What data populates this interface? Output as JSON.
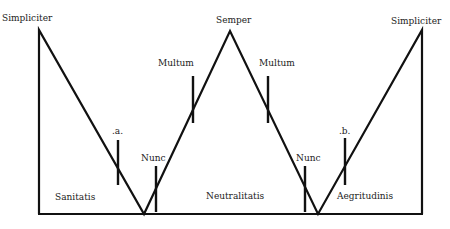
{
  "colors": {
    "line": "#111111",
    "text": "#222222",
    "background": "#ffffff"
  },
  "labels": {
    "simpliciter_left": "Simpliciter",
    "semper": "Semper",
    "simpliciter_right": "Simpliciter",
    "multum_left": "Multum",
    "multum_right": "Multum",
    "mark_a": ".a.",
    "mark_b": ".b.",
    "nunc_left": "Nunc",
    "nunc_right": "Nunc",
    "sanitatis": "Sanitatis",
    "neutralitatis": "Neutralitatis",
    "aegritudinis": "Aegritudinis"
  }
}
